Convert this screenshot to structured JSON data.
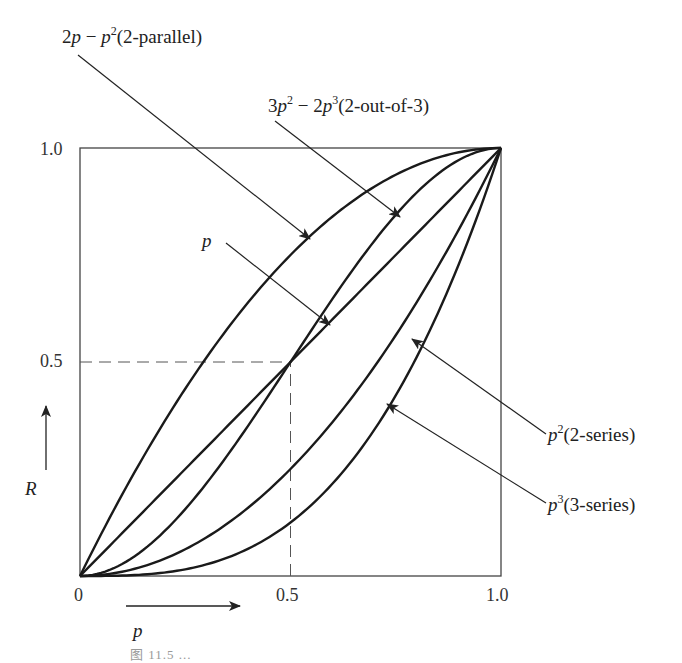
{
  "figure": {
    "caption": "图 11.5 ...",
    "axis": {
      "x_label": "p",
      "y_label": "R",
      "x_ticks": [
        "0",
        "0.5",
        "1.0"
      ],
      "y_ticks": [
        "0.5",
        "1.0"
      ]
    },
    "labels": {
      "parallel": {
        "expr_a": "2",
        "expr_p": "p",
        "expr_b": " − ",
        "expr_p2": "p",
        "sup": "2",
        "desc": "(2-parallel)"
      },
      "two_of_three": {
        "expr_a": "3",
        "expr_p": "p",
        "sup1": "2",
        "expr_b": " − 2",
        "expr_p2": "p",
        "sup2": "3",
        "desc": "(2-out-of-3)"
      },
      "linear": {
        "expr": "p"
      },
      "series2": {
        "expr": "p",
        "sup": "2",
        "desc": "(2-series)"
      },
      "series3": {
        "expr": "p",
        "sup": "3",
        "desc": "(3-series)"
      }
    }
  },
  "chart_data": {
    "type": "line",
    "title": "",
    "xlabel": "p",
    "ylabel": "R",
    "xlim": [
      0,
      1
    ],
    "ylim": [
      0,
      1
    ],
    "grid": false,
    "x_ticks": [
      0,
      0.5,
      1.0
    ],
    "y_ticks": [
      0.5,
      1.0
    ],
    "reference_lines": [
      {
        "type": "dashed",
        "from": [
          0,
          0.5
        ],
        "to": [
          0.5,
          0.5
        ]
      },
      {
        "type": "dashed",
        "from": [
          0.5,
          0
        ],
        "to": [
          0.5,
          0.5
        ]
      }
    ],
    "series": [
      {
        "name": "2p − p² (2-parallel)",
        "formula": "2p-p^2"
      },
      {
        "name": "3p² − 2p³ (2-out-of-3)",
        "formula": "3p^2-2p^3"
      },
      {
        "name": "p",
        "formula": "p"
      },
      {
        "name": "p² (2-series)",
        "formula": "p^2"
      },
      {
        "name": "p³ (3-series)",
        "formula": "p^3"
      }
    ],
    "x": [
      0,
      0.1,
      0.2,
      0.3,
      0.4,
      0.5,
      0.6,
      0.7,
      0.8,
      0.9,
      1.0
    ],
    "values": {
      "2-parallel": [
        0,
        0.19,
        0.36,
        0.51,
        0.64,
        0.75,
        0.84,
        0.91,
        0.96,
        0.99,
        1.0
      ],
      "2-out-of-3": [
        0,
        0.028,
        0.104,
        0.216,
        0.352,
        0.5,
        0.648,
        0.784,
        0.896,
        0.972,
        1.0
      ],
      "p": [
        0,
        0.1,
        0.2,
        0.3,
        0.4,
        0.5,
        0.6,
        0.7,
        0.8,
        0.9,
        1.0
      ],
      "2-series": [
        0,
        0.01,
        0.04,
        0.09,
        0.16,
        0.25,
        0.36,
        0.49,
        0.64,
        0.81,
        1.0
      ],
      "3-series": [
        0,
        0.001,
        0.008,
        0.027,
        0.064,
        0.125,
        0.216,
        0.343,
        0.512,
        0.729,
        1.0
      ]
    }
  }
}
